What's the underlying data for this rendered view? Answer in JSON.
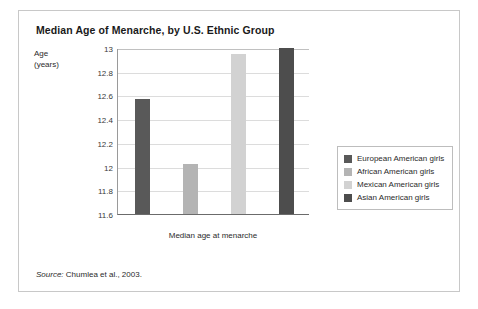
{
  "figure": {
    "title": "Median Age of Menarche, by U.S. Ethnic Group",
    "axis_title_line1": "Age",
    "axis_title_line2": "(years)",
    "source_label": "Source:",
    "source_text": "Chumlea et al., 2003."
  },
  "legend": {
    "items": [
      {
        "label": "European American girls",
        "color": "#595959"
      },
      {
        "label": "African American girls",
        "color": "#b4b4b4"
      },
      {
        "label": "Mexican American girls",
        "color": "#d2d2d2"
      },
      {
        "label": "Asian American girls",
        "color": "#4d4d4d"
      }
    ]
  },
  "chart_data": {
    "type": "bar",
    "title": "Median Age of Menarche, by U.S. Ethnic Group",
    "xlabel": "Median age at menarche",
    "ylabel": "Age (years)",
    "ylim": [
      11.6,
      13
    ],
    "ytick_step": 0.2,
    "yticks": [
      "13",
      "12.8",
      "12.6",
      "12.4",
      "12.2",
      "12",
      "11.8",
      "11.6"
    ],
    "grid": true,
    "legend_position": "right",
    "categories": [
      "European American girls",
      "African American girls",
      "Mexican American girls",
      "Asian American girls"
    ],
    "values": [
      12.57,
      12.02,
      12.95,
      13.0
    ],
    "colors": [
      "#595959",
      "#b4b4b4",
      "#d2d2d2",
      "#4d4d4d"
    ],
    "annotations": [
      "Source: Chumlea et al., 2003."
    ]
  }
}
